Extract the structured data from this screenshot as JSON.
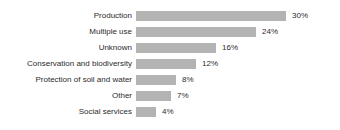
{
  "chart_data": {
    "type": "bar",
    "orientation": "horizontal",
    "title": "",
    "subtitle": "",
    "xlabel": "",
    "ylabel": "",
    "grid": false,
    "legend": false,
    "axis_visible": false,
    "value_suffix": "%",
    "xlim": [
      0,
      30
    ],
    "px_per_unit": 5,
    "bar_color": "#b3b3b3",
    "text_color": "#2b2b2b",
    "background": "#ffffff",
    "categories": [
      "Production",
      "Multiple use",
      "Unknown",
      "Conservation and biodiversity",
      "Protection of soil and water",
      "Other",
      "Social services"
    ],
    "values": [
      30,
      24,
      16,
      12,
      8,
      7,
      4
    ],
    "value_labels": [
      "30%",
      "24%",
      "16%",
      "12%",
      "8%",
      "7%",
      "4%"
    ]
  }
}
